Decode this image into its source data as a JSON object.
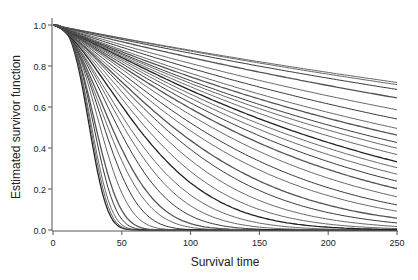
{
  "chart_data": {
    "type": "line",
    "title": "",
    "xlabel": "Survival time",
    "ylabel": "Estimated survivor function",
    "xlim": [
      0,
      250
    ],
    "ylim": [
      0,
      1
    ],
    "x_ticks": [
      0,
      50,
      100,
      150,
      200,
      250
    ],
    "x_tick_labels": [
      "0",
      "50",
      "100",
      "150",
      "200",
      "250"
    ],
    "y_ticks": [
      0,
      0.2,
      0.4,
      0.6,
      0.8,
      1.0
    ],
    "y_tick_labels": [
      "0.0",
      "0.2",
      "0.4",
      "0.6",
      "0.8",
      "1.0"
    ],
    "grid": false,
    "legend": "none",
    "series_model": "Weibull S(t)=exp(-(t/scale)^shape)",
    "series": [
      {
        "scale": 30,
        "shape": 3.0,
        "value_at_250": 0.0
      },
      {
        "scale": 31,
        "shape": 3.0,
        "value_at_250": 0.0
      },
      {
        "scale": 32,
        "shape": 2.9,
        "value_at_250": 0.0
      },
      {
        "scale": 34,
        "shape": 2.8,
        "value_at_250": 0.0
      },
      {
        "scale": 36,
        "shape": 2.6,
        "value_at_250": 0.0
      },
      {
        "scale": 40,
        "shape": 2.4,
        "value_at_250": 0.0
      },
      {
        "scale": 44,
        "shape": 2.2,
        "value_at_250": 0.0
      },
      {
        "scale": 48,
        "shape": 2.0,
        "value_at_250": 0.0
      },
      {
        "scale": 52,
        "shape": 1.9,
        "value_at_250": 0.0
      },
      {
        "scale": 58,
        "shape": 1.8,
        "value_at_250": 0.0
      },
      {
        "scale": 64,
        "shape": 1.7,
        "value_at_250": 0.0
      },
      {
        "scale": 70,
        "shape": 1.6,
        "value_at_250": 0.0
      },
      {
        "scale": 78,
        "shape": 1.55,
        "value_at_250": 0.0
      },
      {
        "scale": 86,
        "shape": 1.5,
        "value_at_250": 0.01
      },
      {
        "scale": 95,
        "shape": 1.45,
        "value_at_250": 0.02
      },
      {
        "scale": 105,
        "shape": 1.4,
        "value_at_250": 0.03
      },
      {
        "scale": 115,
        "shape": 1.35,
        "value_at_250": 0.05
      },
      {
        "scale": 128,
        "shape": 1.3,
        "value_at_250": 0.08
      },
      {
        "scale": 140,
        "shape": 1.28,
        "value_at_250": 0.11
      },
      {
        "scale": 155,
        "shape": 1.25,
        "value_at_250": 0.15
      },
      {
        "scale": 170,
        "shape": 1.22,
        "value_at_250": 0.2
      },
      {
        "scale": 185,
        "shape": 1.2,
        "value_at_250": 0.24
      },
      {
        "scale": 200,
        "shape": 1.18,
        "value_at_250": 0.28
      },
      {
        "scale": 215,
        "shape": 1.16,
        "value_at_250": 0.31
      },
      {
        "scale": 230,
        "shape": 1.15,
        "value_at_250": 0.34
      },
      {
        "scale": 250,
        "shape": 1.12,
        "value_at_250": 0.37
      },
      {
        "scale": 270,
        "shape": 1.1,
        "value_at_250": 0.4
      },
      {
        "scale": 290,
        "shape": 1.08,
        "value_at_250": 0.43
      },
      {
        "scale": 320,
        "shape": 1.06,
        "value_at_250": 0.47
      },
      {
        "scale": 350,
        "shape": 1.05,
        "value_at_250": 0.5
      },
      {
        "scale": 400,
        "shape": 1.04,
        "value_at_250": 0.54
      },
      {
        "scale": 460,
        "shape": 1.03,
        "value_at_250": 0.58
      },
      {
        "scale": 560,
        "shape": 1.02,
        "value_at_250": 0.64
      },
      {
        "scale": 650,
        "shape": 1.02,
        "value_at_250": 0.68
      },
      {
        "scale": 720,
        "shape": 1.01,
        "value_at_250": 0.7
      },
      {
        "scale": 760,
        "shape": 1.0,
        "value_at_250": 0.72
      }
    ]
  }
}
